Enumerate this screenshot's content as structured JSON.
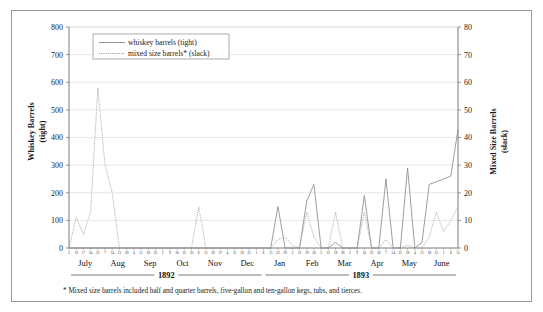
{
  "chart_data": {
    "type": "line",
    "title": "",
    "xlabel": "",
    "ylabel": "Whiskey Barrels (tight)",
    "y2label": "Mixed Size Barrels (slack)",
    "ylim": [
      0,
      800
    ],
    "y2lim": [
      0,
      80
    ],
    "yticks": [
      0,
      100,
      200,
      300,
      400,
      500,
      600,
      700,
      800
    ],
    "y2ticks": [
      0,
      10,
      20,
      30,
      40,
      50,
      60,
      70,
      80
    ],
    "grid": true,
    "legend_position": "top-left",
    "footnote": "* Mixed size barrels included half and quarter barrels, five-gallon and ten-gallon kegs, tubs, and tierces.",
    "years": [
      {
        "label": "1892",
        "months": [
          "July",
          "Aug",
          "Sep",
          "Oct",
          "Nov",
          "Dec"
        ]
      },
      {
        "label": "1893",
        "months": [
          "Jan",
          "Feb",
          "Mar",
          "Apr",
          "May",
          "June"
        ]
      }
    ],
    "x_tick_labels": [
      "3",
      "10",
      "17",
      "24",
      "31",
      "7",
      "14",
      "21",
      "28",
      "4",
      "11",
      "18",
      "25",
      "2",
      "9",
      "16",
      "23",
      "30",
      "6",
      "13",
      "20",
      "27",
      "4",
      "11",
      "18",
      "25",
      "1",
      "8",
      "15",
      "22",
      "29",
      "5",
      "12",
      "19",
      "26",
      "5",
      "12",
      "19",
      "26",
      "2",
      "9",
      "16",
      "23",
      "30",
      "7",
      "14",
      "21",
      "28",
      "4",
      "11",
      "18",
      "25",
      "1",
      "8",
      "15"
    ],
    "series": [
      {
        "name": "whiskey barrels (tight)",
        "style": "solid",
        "axis": "left",
        "values": [
          0,
          0,
          0,
          0,
          0,
          0,
          0,
          0,
          0,
          0,
          0,
          0,
          0,
          0,
          0,
          0,
          0,
          0,
          0,
          0,
          0,
          0,
          0,
          0,
          0,
          0,
          0,
          0,
          0,
          150,
          0,
          0,
          0,
          170,
          230,
          0,
          0,
          20,
          0,
          0,
          0,
          190,
          0,
          0,
          250,
          0,
          0,
          290,
          0,
          20,
          230,
          240,
          250,
          260,
          430,
          200,
          480,
          380,
          550,
          400,
          450,
          540,
          530,
          430,
          450,
          450,
          510,
          490,
          600,
          590,
          450,
          490,
          470,
          300,
          120,
          20,
          0,
          0,
          0,
          0
        ]
      },
      {
        "name": "mixed size barrels* (slack)",
        "style": "dotted",
        "axis": "right",
        "values": [
          0,
          11,
          5,
          13,
          58,
          30,
          20,
          0,
          0,
          0,
          0,
          0,
          0,
          0,
          0,
          0,
          0,
          0,
          15,
          0,
          0,
          0,
          0,
          0,
          0,
          0,
          0,
          0,
          0,
          3,
          4,
          1,
          0,
          13,
          4,
          0,
          0,
          13,
          0,
          0,
          0,
          13,
          0,
          0,
          3,
          0,
          0,
          1,
          0,
          0,
          4,
          13,
          6,
          10,
          15,
          2,
          0,
          0,
          0,
          0,
          0,
          0,
          0,
          0,
          0,
          0,
          0,
          0,
          0,
          0,
          0,
          0,
          0,
          0,
          0,
          2,
          0,
          0,
          0,
          0
        ]
      }
    ]
  },
  "legend": {
    "items": [
      {
        "label": "whiskey barrels (tight)",
        "style": "solid"
      },
      {
        "label": "mixed size barrels* (slack)",
        "style": "dotted"
      }
    ]
  }
}
